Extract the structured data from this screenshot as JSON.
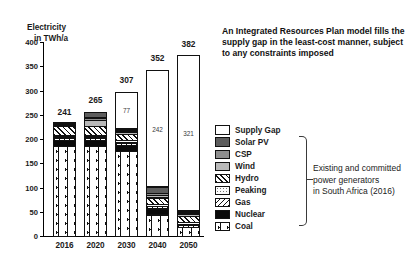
{
  "chart_data": {
    "type": "bar",
    "title": "",
    "ylabel": "Electricity in TWh/a",
    "xlabel": "",
    "ylim": [
      0,
      400
    ],
    "yticks": [
      0,
      50,
      100,
      150,
      200,
      250,
      300,
      350,
      400
    ],
    "grid": false,
    "legend_position": "right",
    "categories": [
      "2016",
      "2020",
      "2030",
      "2040",
      "2050"
    ],
    "totals": [
      241,
      265,
      307,
      352,
      382
    ],
    "gap_labels": [
      "",
      "",
      "77",
      "242",
      "321"
    ],
    "series": [
      {
        "name": "Coal",
        "key": "coal",
        "fill": "dotted-grid",
        "values": [
          186,
          186,
          176,
          45,
          20
        ]
      },
      {
        "name": "Nuclear",
        "key": "nuclear",
        "fill": "solid-black",
        "values": [
          14,
          14,
          14,
          14,
          0
        ]
      },
      {
        "name": "Gas",
        "key": "gas",
        "fill": "diagonal-hatch-left",
        "values": [
          6,
          6,
          6,
          6,
          6
        ]
      },
      {
        "name": "Peaking",
        "key": "peaking",
        "fill": "fine-dots",
        "values": [
          6,
          6,
          6,
          6,
          6
        ]
      },
      {
        "name": "Hydro",
        "key": "hydro",
        "fill": "diagonal-hatch-right",
        "values": [
          20,
          20,
          14,
          14,
          14
        ]
      },
      {
        "name": "Wind",
        "key": "wind",
        "fill": "light-gray",
        "values": [
          4,
          14,
          6,
          6,
          6
        ]
      },
      {
        "name": "CSP",
        "key": "csp",
        "fill": "medium-gray",
        "values": [
          2,
          6,
          4,
          6,
          4
        ]
      },
      {
        "name": "Solar PV",
        "key": "solar",
        "fill": "dark-gray",
        "values": [
          3,
          13,
          4,
          13,
          5
        ]
      },
      {
        "name": "Supply Gap",
        "key": "gap",
        "fill": "white",
        "values": [
          0,
          0,
          77,
          242,
          321
        ]
      }
    ]
  },
  "axis": {
    "y_title_line1": "Electricity",
    "y_title_line2": "in TWh/a"
  },
  "annotation": {
    "text": "An Integrated Resources Plan model fills the supply gap in the least-cost manner, subject to any constraints imposed"
  },
  "legend": {
    "items": [
      {
        "label": "Supply Gap",
        "swatch": "gap"
      },
      {
        "label": "Solar PV",
        "swatch": "solar"
      },
      {
        "label": "CSP",
        "swatch": "csp"
      },
      {
        "label": "Wind",
        "swatch": "wind"
      },
      {
        "label": "Hydro",
        "swatch": "hydro"
      },
      {
        "label": "Peaking",
        "swatch": "peaking"
      },
      {
        "label": "Gas",
        "swatch": "gas"
      },
      {
        "label": "Nuclear",
        "swatch": "nuclear"
      },
      {
        "label": "Coal",
        "swatch": "coal"
      }
    ]
  },
  "side_note": {
    "line1": "Existing and committed",
    "line2": "power generators",
    "line3": "in South Africa (2016)"
  },
  "colors": {
    "solar": "#5d5d5d",
    "csp": "#8e8e8e",
    "wind": "#b9b9b9",
    "nuclear": "#0a0a0a",
    "axis": "#000000"
  }
}
